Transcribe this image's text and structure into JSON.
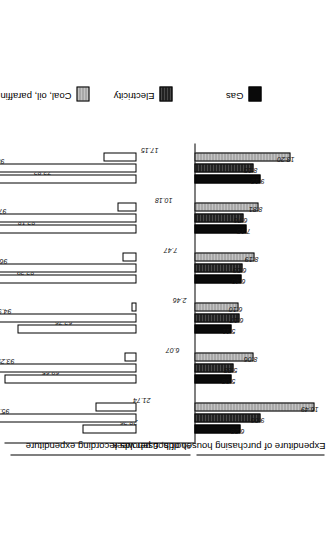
{
  "chart_data": {
    "type": "bar",
    "title": "",
    "orientation": "vertical-bidirectional",
    "categories": [
      "Other",
      "Converted flat or house",
      "Designed flat",
      "Terraced",
      "Semi-detached",
      "Detached"
    ],
    "axes": {
      "top_axis_label": "% of households recording expenditure",
      "bottom_axis_label": "Expenditure of purchasing households, £ per week",
      "top_axis_range": [
        0,
        100
      ],
      "bottom_axis_range": [
        0,
        18
      ],
      "grid": false
    },
    "legend": {
      "position": "right",
      "entries": [
        {
          "label": "Gas",
          "color": "#0a0a0a",
          "key": "gas"
        },
        {
          "label": "Electricity",
          "color": "#3b3b3b",
          "key": "electricity"
        },
        {
          "label": "Coal, oil, paraffin",
          "color": "#b2b2b2",
          "key": "coal"
        }
      ]
    },
    "series": [
      {
        "name": "% of households recording expenditure",
        "axis": "top",
        "bars": [
          {
            "name": "Gas",
            "values": [
              28.26,
              69.65,
              62.76,
              82.39,
              82.18,
              73.82
            ]
          },
          {
            "name": "Electricity",
            "values": [
              95.65,
              93.29,
              94.98,
              96.76,
              97.22,
              98.33
            ]
          },
          {
            "name": "Coal, oil, paraffin",
            "values": [
              21.74,
              6.07,
              2.46,
              7.47,
              10.18,
              17.15
            ]
          }
        ]
      },
      {
        "name": "Expenditure of purchasing households, £ per week",
        "axis": "bottom",
        "bars": [
          {
            "name": "Gas",
            "values": [
              6.28,
              5.08,
              5.11,
              6.4,
              7.15,
              9.12
            ]
          },
          {
            "name": "Electricity",
            "values": [
              9.06,
              5.38,
              6.17,
              6.59,
              6.76,
              8.15
            ]
          },
          {
            "name": "Coal, oil, paraffin",
            "values": [
              16.49,
              8.06,
              6.1,
              8.19,
              8.81,
              13.2
            ]
          }
        ]
      }
    ]
  },
  "labels": {
    "pct_axis": "% of households recording expenditure",
    "exp_axis": "Expenditure of purchasing households, £ per week",
    "cat_0": "Other",
    "cat_1": "Converted flat or house",
    "cat_2": "Designed flat",
    "cat_3": "Terraced",
    "cat_4": "Semi-detached",
    "cat_5": "Detached",
    "leg_0": "Gas",
    "leg_1": "Electricity",
    "leg_2": "Coal, oil, paraffin"
  }
}
